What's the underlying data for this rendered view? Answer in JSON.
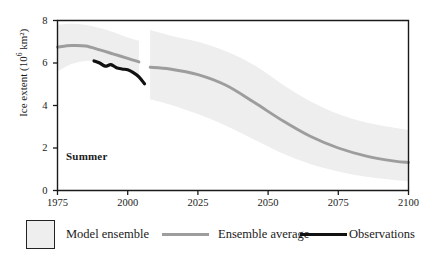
{
  "chart_data": {
    "type": "area",
    "title": "",
    "subtitle": "",
    "xlabel": "",
    "ylabel": "Ice extent (10⁶ km²)",
    "ylabel_base": "Ice extent (10",
    "ylabel_exp": "6",
    "ylabel_tail": " km²)",
    "annotation": "Summer",
    "grid": false,
    "legend_position": "below-plot",
    "xlim": [
      1975,
      2100
    ],
    "ylim": [
      0,
      8
    ],
    "xticks": [
      1975,
      2000,
      2025,
      2050,
      2075,
      2100
    ],
    "xtick_labels": [
      "1975",
      "2000",
      "2025",
      "2050",
      "2075",
      "2100"
    ],
    "yticks": [
      0,
      2,
      4,
      6,
      8
    ],
    "ytick_labels": [
      "0",
      "2",
      "4",
      "6",
      "8"
    ],
    "colors": {
      "ensemble_band": "#eeeeee",
      "ensemble_average": "#9d9d9d",
      "observations": "#111111",
      "axis": "#1a1a1a",
      "swatch_fill": "#eeeeee",
      "swatch_border": "#222222"
    },
    "series": [
      {
        "name": "Model ensemble",
        "kind": "band",
        "note": "shaded spread of model runs; historical segment 1975-2004 then gap, scenario segment 2008-2100",
        "segments": [
          {
            "label": "historical",
            "x": [
              1975,
              1980,
              1985,
              1990,
              1995,
              2000,
              2004
            ],
            "upper": [
              7.8,
              7.85,
              7.8,
              7.65,
              7.45,
              7.2,
              7.05
            ],
            "lower": [
              5.6,
              5.95,
              6.1,
              6.05,
              5.9,
              5.7,
              5.45
            ]
          },
          {
            "label": "scenario",
            "x": [
              2008,
              2015,
              2025,
              2035,
              2045,
              2055,
              2065,
              2075,
              2085,
              2095,
              2100
            ],
            "upper": [
              7.55,
              7.3,
              7.0,
              6.55,
              5.9,
              5.0,
              4.2,
              3.6,
              3.2,
              2.95,
              2.85
            ],
            "lower": [
              4.3,
              4.05,
              3.6,
              3.05,
              2.4,
              1.75,
              1.25,
              0.9,
              0.65,
              0.5,
              0.45
            ]
          }
        ]
      },
      {
        "name": "Ensemble average",
        "kind": "line",
        "segments": [
          {
            "label": "historical",
            "x": [
              1975,
              1980,
              1985,
              1990,
              1995,
              2000,
              2004
            ],
            "y": [
              6.75,
              6.82,
              6.8,
              6.62,
              6.42,
              6.22,
              6.05
            ]
          },
          {
            "label": "scenario",
            "x": [
              2008,
              2015,
              2025,
              2035,
              2045,
              2055,
              2065,
              2075,
              2085,
              2095,
              2100
            ],
            "y": [
              5.8,
              5.72,
              5.45,
              4.95,
              4.15,
              3.3,
              2.55,
              2.0,
              1.62,
              1.38,
              1.32
            ]
          }
        ]
      },
      {
        "name": "Observations",
        "kind": "line",
        "segments": [
          {
            "label": "observed",
            "x": [
              1988,
              1990,
              1992,
              1994,
              1996,
              1998,
              2000,
              2002,
              2004,
              2006
            ],
            "y": [
              6.1,
              6.0,
              5.85,
              5.92,
              5.78,
              5.72,
              5.68,
              5.55,
              5.35,
              5.02
            ]
          }
        ]
      }
    ]
  },
  "legend": {
    "items": [
      {
        "label": "Model ensemble",
        "marker": "swatch",
        "color": "#eeeeee"
      },
      {
        "label": "Ensemble average",
        "marker": "line-gray",
        "color": "#9d9d9d"
      },
      {
        "label": "Observations",
        "marker": "line-black",
        "color": "#111111"
      }
    ]
  }
}
